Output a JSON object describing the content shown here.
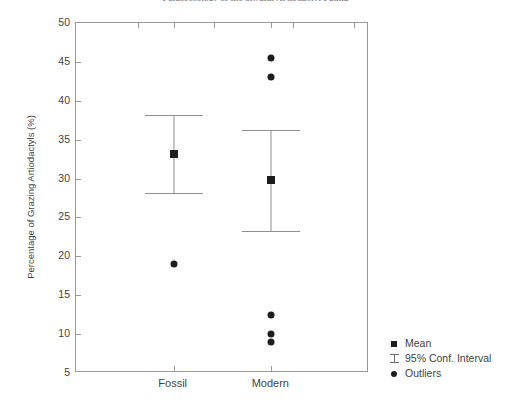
{
  "chart_data": {
    "type": "scatter",
    "title": "Palaeoecology of the Siwalik Artiodactyl Fauna",
    "xlabel": "",
    "ylabel": "Percentage of Grazing Artiodactyls (%)",
    "categories": [
      "Fossil",
      "Modern"
    ],
    "ylim": [
      5,
      50
    ],
    "yticks": [
      5,
      10,
      15,
      20,
      25,
      30,
      35,
      40,
      45,
      50
    ],
    "ytick_labels": [
      "5",
      "10",
      "15",
      "20",
      "25",
      "30",
      "35",
      "40",
      "45",
      "50"
    ],
    "grid": false,
    "legend_position": "right-bottom-outside",
    "series": [
      {
        "name": "Mean",
        "marker": "square",
        "color": "#1d1d1d",
        "values": [
          33.2,
          29.8
        ]
      },
      {
        "name": "95% Conf. Interval",
        "marker": "errorbar",
        "color": "#8e8e8e",
        "lower": [
          28.2,
          23.2
        ],
        "upper": [
          38.2,
          36.3
        ]
      },
      {
        "name": "Outliers",
        "marker": "circle",
        "color": "#1d1d1d",
        "points": [
          {
            "category": "Fossil",
            "value": 19.0
          },
          {
            "category": "Modern",
            "value": 45.5
          },
          {
            "category": "Modern",
            "value": 43.0
          },
          {
            "category": "Modern",
            "value": 12.5
          },
          {
            "category": "Modern",
            "value": 10.0
          },
          {
            "category": "Modern",
            "value": 9.0
          }
        ]
      }
    ]
  },
  "legend": {
    "items": [
      {
        "label": "Mean",
        "key": "square-marker-icon"
      },
      {
        "label": "95% Conf. Interval",
        "key": "errorbar-icon"
      },
      {
        "label": "Outliers",
        "key": "circle-marker-icon"
      }
    ]
  }
}
